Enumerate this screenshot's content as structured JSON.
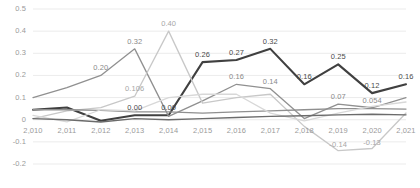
{
  "chart_data": {
    "type": "line",
    "title": "",
    "xlabel": "",
    "ylabel": "",
    "grid": true,
    "legend": "none",
    "ylim": [
      -0.2,
      0.5
    ],
    "yticks": [
      "0.5",
      "0.4",
      "0.3",
      "0.2",
      "0.1",
      "0",
      "-0.1",
      "-0.2"
    ],
    "ytick_values": [
      0.5,
      0.4,
      0.3,
      0.2,
      0.1,
      0,
      -0.1,
      -0.2
    ],
    "categories": [
      "2,010",
      "2,011",
      "2,012",
      "2,013",
      "2,014",
      "2,015",
      "2,016",
      "2,017",
      "2,018",
      "2,019",
      "2,020",
      "2,021"
    ],
    "x": [
      2010,
      2011,
      2012,
      2013,
      2014,
      2015,
      2016,
      2017,
      2018,
      2019,
      2020,
      2021
    ],
    "series": [
      {
        "name": "series-dark",
        "color": "#404040",
        "width": 2.1,
        "values": [
          0.045,
          0.055,
          -0.005,
          0.02,
          0.02,
          0.26,
          0.27,
          0.32,
          0.16,
          0.25,
          0.12,
          0.16
        ],
        "labels": [
          "",
          "",
          "",
          "0.00",
          "0.00",
          "0.26",
          "0.27",
          "0.32",
          "0.16",
          "0.25",
          "0.12",
          "0.16"
        ]
      },
      {
        "name": "series-mid-gray",
        "color": "#909090",
        "width": 1.3,
        "values": [
          0.1,
          0.145,
          0.2,
          0.32,
          0.015,
          0.085,
          0.16,
          0.14,
          0.005,
          0.07,
          0.054,
          0.1
        ],
        "labels": [
          "",
          "",
          "0.20",
          "0.32",
          "",
          "",
          "0.16",
          "0.14",
          "",
          "0.07",
          "0.054",
          ""
        ]
      },
      {
        "name": "series-light-peak",
        "color": "#c8c8c8",
        "width": 1.3,
        "values": [
          0.005,
          0.04,
          0.055,
          0.106,
          0.4,
          0.075,
          0.1,
          0.115,
          -0.03,
          -0.14,
          -0.13,
          0.03
        ],
        "labels": [
          "",
          "",
          "",
          "0.106",
          "0.40",
          "",
          "",
          "",
          "",
          "-0.14",
          "-0.13",
          ""
        ]
      },
      {
        "name": "series-flat-gray",
        "color": "#8f8f8f",
        "width": 1.3,
        "values": [
          0.045,
          0.045,
          0.042,
          0.035,
          0.035,
          0.03,
          0.035,
          0.04,
          0.045,
          0.05,
          0.05,
          0.048
        ],
        "labels": [
          "",
          "",
          "",
          "",
          "",
          "",
          "",
          "",
          "",
          "",
          "",
          ""
        ]
      },
      {
        "name": "series-pale",
        "color": "#d8d8d8",
        "width": 1.3,
        "values": [
          0.02,
          -0.01,
          0.045,
          0.04,
          0.1,
          0.115,
          0.115,
          0.03,
          -0.005,
          0.03,
          0.06,
          0.08
        ],
        "labels": [
          "",
          "",
          "",
          "",
          "",
          "",
          "",
          "",
          "",
          "",
          "",
          ""
        ]
      },
      {
        "name": "series-dark-low",
        "color": "#6b6b6b",
        "width": 1.4,
        "values": [
          0.005,
          0.0,
          -0.01,
          0.005,
          0.0,
          0.005,
          0.01,
          0.015,
          0.018,
          0.022,
          0.025,
          0.022
        ],
        "labels": [
          "",
          "",
          "",
          "",
          "",
          "",
          "",
          "",
          "",
          "",
          "",
          ""
        ]
      }
    ],
    "annotations": [
      {
        "text": "0.20",
        "x": 2012,
        "y": 0.2,
        "style": "mid"
      },
      {
        "text": "0.32",
        "x": 2013,
        "y": 0.32,
        "style": "mid"
      },
      {
        "text": "0.106",
        "x": 2013,
        "y": 0.106,
        "style": "light"
      },
      {
        "text": "0.40",
        "x": 2014,
        "y": 0.4,
        "style": "light"
      },
      {
        "text": "0.00",
        "x": 2013,
        "y": 0.02,
        "style": "dark"
      },
      {
        "text": "0.00",
        "x": 2014,
        "y": 0.02,
        "style": "dark"
      },
      {
        "text": "0.26",
        "x": 2015,
        "y": 0.26,
        "style": "dark"
      },
      {
        "text": "0.27",
        "x": 2016,
        "y": 0.27,
        "style": "dark"
      },
      {
        "text": "0.32",
        "x": 2017,
        "y": 0.32,
        "style": "dark"
      },
      {
        "text": "0.16",
        "x": 2016,
        "y": 0.16,
        "style": "mid"
      },
      {
        "text": "0.14",
        "x": 2017,
        "y": 0.14,
        "style": "mid"
      },
      {
        "text": "0.16",
        "x": 2018,
        "y": 0.16,
        "style": "dark"
      },
      {
        "text": "0.25",
        "x": 2019,
        "y": 0.25,
        "style": "dark"
      },
      {
        "text": "0.07",
        "x": 2019,
        "y": 0.07,
        "style": "mid"
      },
      {
        "text": "0.12",
        "x": 2020,
        "y": 0.12,
        "style": "dark"
      },
      {
        "text": "0.054",
        "x": 2020,
        "y": 0.054,
        "style": "mid"
      },
      {
        "text": "0.16",
        "x": 2021,
        "y": 0.16,
        "style": "dark"
      },
      {
        "text": "-0.14",
        "x": 2019,
        "y": -0.14,
        "style": "light"
      },
      {
        "text": "-0.13",
        "x": 2020,
        "y": -0.13,
        "style": "light"
      }
    ]
  }
}
